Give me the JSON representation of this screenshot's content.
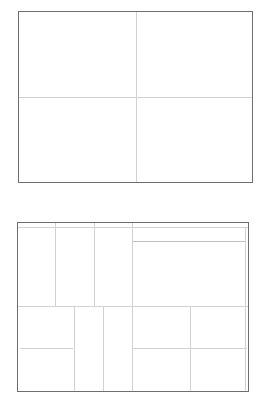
{
  "diagrams": [
    {
      "name": "four-quadrant-grid",
      "frame": {
        "x": 18,
        "y": 11,
        "w": 235,
        "h": 172
      },
      "lines": [
        {
          "orient": "v",
          "x": 136,
          "y": 12,
          "len": 170,
          "dark": false
        },
        {
          "orient": "h",
          "x": 19,
          "y": 97,
          "len": 233,
          "dark": false
        }
      ]
    },
    {
      "name": "partitioned-layout-grid",
      "frame": {
        "x": 17,
        "y": 222,
        "w": 232,
        "h": 170
      },
      "lines": [
        {
          "orient": "h",
          "x": 18,
          "y": 227,
          "len": 230,
          "dark": false
        },
        {
          "orient": "v",
          "x": 55,
          "y": 223,
          "len": 84,
          "dark": false
        },
        {
          "orient": "v",
          "x": 94,
          "y": 223,
          "len": 84,
          "dark": false
        },
        {
          "orient": "v",
          "x": 132,
          "y": 223,
          "len": 168,
          "dark": false
        },
        {
          "orient": "h",
          "x": 133,
          "y": 241,
          "len": 112,
          "dark": true
        },
        {
          "orient": "v",
          "x": 245,
          "y": 227,
          "len": 164,
          "dark": false
        },
        {
          "orient": "h",
          "x": 18,
          "y": 306,
          "len": 230,
          "dark": false
        },
        {
          "orient": "v",
          "x": 74,
          "y": 306,
          "len": 85,
          "dark": false
        },
        {
          "orient": "v",
          "x": 103,
          "y": 306,
          "len": 85,
          "dark": false
        },
        {
          "orient": "v",
          "x": 190,
          "y": 306,
          "len": 85,
          "dark": false
        },
        {
          "orient": "h",
          "x": 20,
          "y": 348,
          "len": 53,
          "dark": false
        },
        {
          "orient": "h",
          "x": 132,
          "y": 348,
          "len": 115,
          "dark": false
        }
      ]
    }
  ]
}
